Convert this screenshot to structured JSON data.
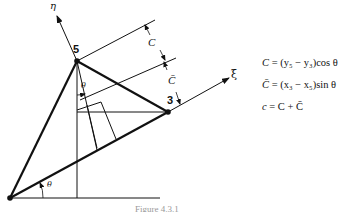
{
  "figure": {
    "axes": {
      "xi_label": "ξ",
      "eta_label": "η"
    },
    "nodes": [
      {
        "id": "5",
        "label": "5",
        "x": 77,
        "y": 61
      },
      {
        "id": "3",
        "label": "3",
        "x": 168,
        "y": 112
      },
      {
        "id": "origin",
        "label": "",
        "x": 10,
        "y": 198
      }
    ],
    "angle_label": "θ",
    "dimensions": {
      "upper_label": "C",
      "lower_label": "C̄"
    },
    "equations": [
      {
        "lhs": "C",
        "rhs": "= (y₅ − y₃)cos θ"
      },
      {
        "lhs": "C̄",
        "rhs": "= (x₃ − x₅)sin θ"
      },
      {
        "lhs": "c",
        "rhs": "= C + C̄"
      }
    ],
    "caption": "Figure 4.3.1"
  }
}
